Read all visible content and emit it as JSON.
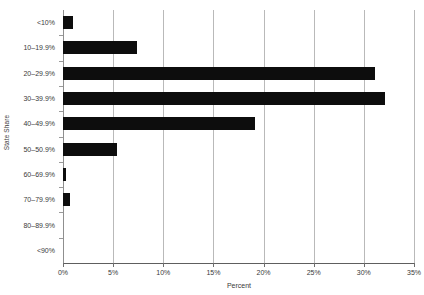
{
  "chart_data": {
    "type": "bar",
    "orientation": "horizontal",
    "title": "",
    "xlabel": "Percent",
    "ylabel": "State Share",
    "categories": [
      "<10%",
      "10–19.9%",
      "20–29.9%",
      "30–39.9%",
      "40–49.9%",
      "50–50.9%",
      "60–69.9%",
      "70–79.9%",
      "80–89.9%",
      "<90%"
    ],
    "values": [
      1.0,
      7.4,
      31.1,
      32.1,
      19.1,
      5.4,
      0.3,
      0.7,
      0.0,
      0.0
    ],
    "xlim": [
      0,
      35
    ],
    "xticks": [
      0,
      5,
      10,
      15,
      20,
      25,
      30,
      35
    ],
    "xtick_labels": [
      "0%",
      "5%",
      "10%",
      "15%",
      "20%",
      "25%",
      "30%",
      "35%"
    ],
    "grid": "vertical",
    "legend": "none",
    "bar_color": "#0d0d0d",
    "gridline_color": "#b9b9b9",
    "axis_color": "#8f8f8f"
  }
}
